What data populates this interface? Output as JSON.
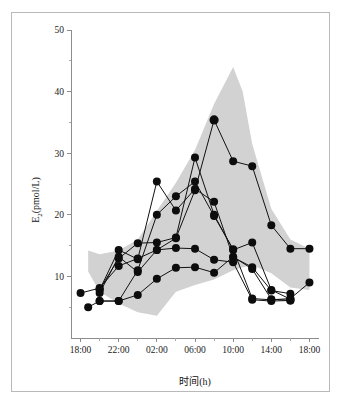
{
  "figure": {
    "border_color": "#b9b9b9",
    "background": "#ffffff"
  },
  "chart_data": {
    "type": "line",
    "title": "",
    "subtitle": "",
    "xlabel": "时间(h)",
    "ylabel": "E₂(pmol/L)",
    "ylabel_base": "E",
    "ylabel_subscript": "2",
    "ylabel_unit": "(pmol/L)",
    "grid": false,
    "legend": "none",
    "xlim": [
      17,
      43
    ],
    "ylim": [
      0,
      50
    ],
    "x_major_ticks": [
      18,
      22,
      26,
      30,
      34,
      38,
      42
    ],
    "x_tick_labels": [
      "18:00",
      "22:00",
      "02:00",
      "06:00",
      "10:00",
      "14:00",
      "18:00"
    ],
    "x_minor_ticks": [
      20,
      24,
      28,
      32,
      36,
      40
    ],
    "y_major_ticks": [
      10,
      20,
      30,
      40,
      50
    ],
    "y_tick_labels": [
      "10",
      "20",
      "30",
      "40",
      "50"
    ],
    "y_minor_ticks": [
      5,
      15,
      25,
      35,
      45
    ],
    "band": {
      "name": "reference range (shaded)",
      "fill": "#d2d2d2",
      "x": [
        18.8,
        20.0,
        22.0,
        24.0,
        26.0,
        28.0,
        30.0,
        32.0,
        34.0,
        35.0,
        36.0,
        38.0,
        40.0,
        42.0
      ],
      "upper": [
        14.2,
        13.6,
        14.2,
        16.0,
        20.6,
        25.2,
        30.5,
        38.0,
        44.0,
        40.0,
        31.5,
        21.0,
        16.0,
        14.5
      ],
      "lower": [
        10.8,
        7.5,
        5.6,
        4.2,
        3.6,
        7.5,
        8.6,
        9.5,
        11.0,
        11.5,
        11.8,
        10.5,
        8.2,
        7.8
      ]
    },
    "series": [
      {
        "name": "subject-1",
        "points": [
          [
            18.0,
            7.3
          ],
          [
            20.0,
            8.1
          ],
          [
            22.0,
            11.7
          ],
          [
            24.0,
            12.9
          ],
          [
            26.0,
            14.3
          ],
          [
            28.0,
            16.2
          ],
          [
            30.0,
            24.0
          ],
          [
            32.0,
            35.4
          ],
          [
            34.0,
            28.7
          ],
          [
            36.0,
            27.9
          ],
          [
            38.0,
            18.3
          ],
          [
            40.0,
            14.5
          ],
          [
            42.0,
            14.5
          ]
        ]
      },
      {
        "name": "subject-2",
        "points": [
          [
            18.8,
            5.0
          ],
          [
            20.0,
            6.0
          ],
          [
            22.0,
            6.0
          ],
          [
            24.0,
            11.0
          ],
          [
            26.0,
            20.0
          ],
          [
            28.0,
            23.0
          ],
          [
            30.0,
            25.4
          ],
          [
            32.0,
            19.8
          ],
          [
            34.0,
            14.4
          ],
          [
            36.0,
            6.4
          ],
          [
            38.0,
            6.2
          ],
          [
            40.0,
            6.4
          ],
          [
            42.0,
            9.0
          ]
        ]
      },
      {
        "name": "subject-3",
        "points": [
          [
            20.0,
            7.8
          ],
          [
            22.0,
            14.3
          ],
          [
            24.0,
            12.8
          ],
          [
            26.0,
            25.4
          ],
          [
            28.0,
            20.7
          ],
          [
            30.0,
            24.2
          ],
          [
            32.0,
            22.1
          ],
          [
            34.0,
            13.1
          ],
          [
            36.0,
            11.5
          ],
          [
            38.0,
            7.7
          ],
          [
            40.0,
            7.2
          ]
        ]
      },
      {
        "name": "subject-4",
        "points": [
          [
            20.0,
            7.9
          ],
          [
            22.0,
            12.9
          ],
          [
            24.0,
            15.4
          ],
          [
            26.0,
            15.5
          ],
          [
            28.0,
            16.3
          ],
          [
            30.0,
            29.3
          ],
          [
            32.0,
            20.0
          ],
          [
            34.0,
            14.3
          ],
          [
            36.0,
            15.5
          ],
          [
            38.0,
            7.8
          ],
          [
            40.0,
            6.3
          ]
        ]
      },
      {
        "name": "subject-5",
        "points": [
          [
            20.0,
            7.3
          ],
          [
            22.0,
            13.2
          ],
          [
            24.0,
            10.7
          ],
          [
            26.0,
            14.3
          ],
          [
            28.0,
            14.6
          ],
          [
            30.0,
            14.5
          ],
          [
            32.0,
            12.7
          ],
          [
            34.0,
            12.3
          ],
          [
            36.0,
            6.2
          ],
          [
            38.0,
            6.0
          ],
          [
            40.0,
            6.1
          ]
        ]
      },
      {
        "name": "subject-6",
        "points": [
          [
            20.0,
            6.0
          ],
          [
            22.0,
            6.0
          ],
          [
            24.0,
            7.0
          ],
          [
            26.0,
            9.6
          ],
          [
            28.0,
            11.4
          ],
          [
            30.0,
            11.5
          ],
          [
            32.0,
            10.6
          ],
          [
            34.0,
            13.2
          ],
          [
            36.0,
            11.2
          ],
          [
            38.0,
            6.3
          ],
          [
            40.0,
            6.1
          ]
        ]
      }
    ]
  }
}
